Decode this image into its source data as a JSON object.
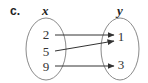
{
  "figure": {
    "part_label": "c.",
    "domain_label": "x",
    "range_label": "y"
  },
  "domain": {
    "values": [
      "2",
      "5",
      "9"
    ]
  },
  "range": {
    "values": [
      "1",
      "3"
    ]
  },
  "mappings": [
    {
      "from": "2",
      "to": "1"
    },
    {
      "from": "5",
      "to": "1"
    },
    {
      "from": "9",
      "to": "3"
    }
  ],
  "colors": {
    "ellipse_stroke": "#8a8a8a",
    "arrow": "#333333",
    "text": "#333333"
  }
}
